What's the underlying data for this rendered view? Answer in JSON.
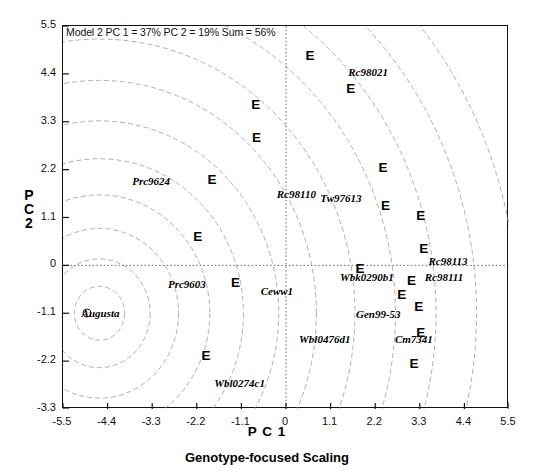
{
  "chart_data": {
    "type": "scatter",
    "title": "Model 2 PC 1 = 37% PC 2 = 19% Sum = 56%",
    "xlabel": "P C 1",
    "ylabel": "P C 2",
    "caption": "Genotype-focused Scaling",
    "xlim": [
      -5.5,
      5.5
    ],
    "ylim": [
      -3.3,
      5.5
    ],
    "xticks": [
      "-5.5",
      "-4.4",
      "-3.3",
      "-2.2",
      "-1.1",
      "0",
      "1.1",
      "2.2",
      "3.3",
      "4.4",
      "5.5"
    ],
    "xtick_values": [
      -5.5,
      -4.4,
      -3.3,
      -2.2,
      -1.1,
      0,
      1.1,
      2.2,
      3.3,
      4.4,
      5.5
    ],
    "yticks": [
      "5.5",
      "4.4",
      "3.3",
      "2.2",
      "1.1",
      "0",
      "-1.1",
      "-2.2",
      "-3.3"
    ],
    "ytick_values": [
      5.5,
      4.4,
      3.3,
      2.2,
      1.1,
      0,
      -1.1,
      -2.2,
      -3.3
    ],
    "grid": false,
    "reference_lines": {
      "x": 0,
      "y": 0,
      "style": "dotted"
    },
    "concentric_circles": {
      "center_x": -4.6,
      "center_y": -1.1,
      "radii": [
        0.62,
        1.25,
        1.95,
        2.72,
        3.55,
        4.42,
        5.35,
        6.3,
        7.3,
        8.3,
        9.3,
        10.3
      ]
    },
    "series": [
      {
        "name": "Environments",
        "marker": "E",
        "points": [
          {
            "label": "E",
            "x": 0.62,
            "y": 4.78
          },
          {
            "label": "E",
            "x": 1.62,
            "y": 4.02
          },
          {
            "label": "E",
            "x": -0.72,
            "y": 3.66
          },
          {
            "label": "E",
            "x": -0.7,
            "y": 2.9
          },
          {
            "label": "E",
            "x": 2.42,
            "y": 2.22
          },
          {
            "label": "E",
            "x": -1.8,
            "y": 1.93
          },
          {
            "label": "E",
            "x": 2.48,
            "y": 1.33
          },
          {
            "label": "E",
            "x": 3.35,
            "y": 1.12
          },
          {
            "label": "E",
            "x": -2.15,
            "y": 0.62
          },
          {
            "label": "E",
            "x": 3.42,
            "y": 0.35
          },
          {
            "label": "E",
            "x": 1.85,
            "y": -0.1
          },
          {
            "label": "E",
            "x": 3.12,
            "y": -0.38
          },
          {
            "label": "E",
            "x": -1.22,
            "y": -0.42
          },
          {
            "label": "E",
            "x": 2.88,
            "y": -0.7
          },
          {
            "label": "E",
            "x": 3.3,
            "y": -0.98
          },
          {
            "label": "E",
            "x": 3.35,
            "y": -1.58
          },
          {
            "label": "E",
            "x": -1.95,
            "y": -2.1
          },
          {
            "label": "E",
            "x": 3.18,
            "y": -2.28
          }
        ]
      },
      {
        "name": "Genotypes",
        "marker": "text",
        "points": [
          {
            "label": "Rc98021",
            "x": 2.05,
            "y": 4.42
          },
          {
            "label": "Prc9624",
            "x": -3.3,
            "y": 1.92
          },
          {
            "label": "Rc98110",
            "x": 0.28,
            "y": 1.62
          },
          {
            "label": "Tw97613",
            "x": 1.38,
            "y": 1.52
          },
          {
            "label": "Rc98113",
            "x": 4.02,
            "y": 0.08
          },
          {
            "label": "Wbk0290b1",
            "x": 2.02,
            "y": -0.28
          },
          {
            "label": "Rc98111",
            "x": 3.92,
            "y": -0.3
          },
          {
            "label": "Prc9603",
            "x": -2.42,
            "y": -0.45
          },
          {
            "label": "Ceww1",
            "x": -0.2,
            "y": -0.62
          },
          {
            "label": "Augusta",
            "x": -4.55,
            "y": -1.12,
            "has_dot": true
          },
          {
            "label": "Gen99-53",
            "x": 2.3,
            "y": -1.15
          },
          {
            "label": "Wbl0476d1",
            "x": 0.98,
            "y": -1.72
          },
          {
            "label": "Cm7341",
            "x": 3.18,
            "y": -1.72
          },
          {
            "label": "Wbl0274c1",
            "x": -1.12,
            "y": -2.72
          }
        ]
      }
    ]
  }
}
